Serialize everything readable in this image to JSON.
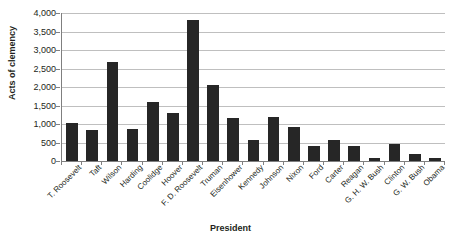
{
  "chart_data": {
    "type": "bar",
    "title": "",
    "xlabel": "President",
    "ylabel": "Acts of clemency",
    "ylim": [
      0,
      4000
    ],
    "ytick_step": 500,
    "ytick_labels": [
      "4,000",
      "3,500",
      "3,000",
      "2,500",
      "2,000",
      "1,500",
      "1,000",
      "500",
      "0"
    ],
    "grid": true,
    "legend": false,
    "bar_color": "#262626",
    "categories": [
      "T. Roosevelt",
      "Taft",
      "Wilson",
      "Harding",
      "Coolidge",
      "Hoover",
      "F. D. Roosevelt",
      "Truman",
      "Eisenhower",
      "Kennedy",
      "Johnson",
      "Nixon",
      "Ford",
      "Carter",
      "Reagan",
      "G. H. W. Bush",
      "Clinton",
      "G. W. Bush",
      "Obama"
    ],
    "values": [
      1030,
      830,
      2670,
      870,
      1600,
      1310,
      3800,
      2050,
      1150,
      570,
      1190,
      930,
      400,
      570,
      400,
      80,
      460,
      200,
      70
    ]
  }
}
